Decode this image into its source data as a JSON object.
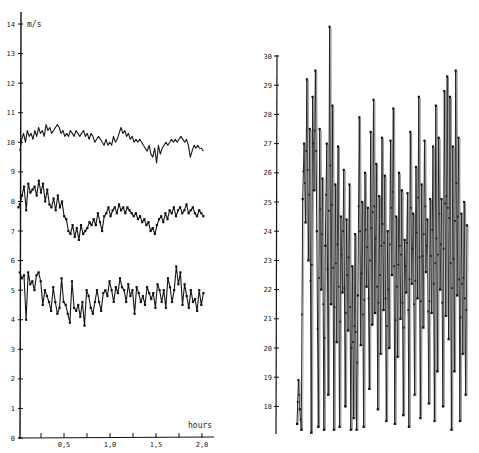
{
  "chart_data": [
    {
      "type": "line",
      "title": "",
      "xlabel": "hours",
      "ylabel": "m/s",
      "xlim": [
        0,
        2.1
      ],
      "ylim": [
        0,
        14
      ],
      "grid": false,
      "legend": "none",
      "x_ticks": [
        0.25,
        0.5,
        0.75,
        1.0,
        1.25,
        1.5,
        1.75,
        2.0
      ],
      "x_tick_labels": [
        {
          "value": 0.5,
          "label": "0,5"
        },
        {
          "value": 1.0,
          "label": "1,0"
        },
        {
          "value": 1.5,
          "label": "1,5"
        },
        {
          "value": 2.0,
          "label": "2,0"
        }
      ],
      "y_ticks": [
        0,
        1,
        2,
        3,
        4,
        5,
        6,
        7,
        8,
        9,
        10,
        11,
        12,
        13,
        14
      ],
      "y_tick_labels": [
        "0",
        "1",
        "2",
        "3",
        "4",
        "5",
        "6",
        "7",
        "8",
        "9",
        "10",
        "11",
        "12",
        "13",
        "14"
      ],
      "x_step": 0.02,
      "series": [
        {
          "name": "upper",
          "marker": "none",
          "values": [
            9.7,
            10.1,
            10.3,
            10.0,
            10.4,
            10.2,
            10.3,
            10.1,
            10.4,
            10.2,
            10.5,
            10.3,
            10.4,
            10.2,
            10.6,
            10.4,
            10.5,
            10.3,
            10.4,
            10.5,
            10.6,
            10.5,
            10.3,
            10.4,
            10.2,
            10.3,
            10.2,
            10.4,
            10.3,
            10.2,
            10.4,
            10.3,
            10.2,
            10.3,
            10.4,
            10.2,
            10.3,
            10.1,
            10.3,
            10.2,
            10.0,
            10.1,
            10.2,
            10.1,
            10.0,
            9.9,
            10.1,
            9.9,
            10.0,
            9.9,
            10.2,
            10.0,
            10.1,
            10.3,
            10.5,
            10.3,
            10.4,
            10.2,
            10.3,
            10.1,
            10.2,
            10.0,
            10.1,
            10.0,
            10.1,
            10.0,
            9.9,
            9.8,
            9.7,
            9.9,
            9.6,
            9.5,
            9.8,
            9.3,
            9.9,
            9.6,
            9.8,
            9.9,
            10.0,
            9.9,
            10.0,
            10.1,
            10.0,
            10.1,
            10.0,
            10.1,
            10.2,
            10.1,
            10.0,
            10.1,
            9.9,
            9.5,
            9.7,
            9.9,
            9.8,
            9.9,
            9.8,
            9.8,
            9.7
          ],
          "min_point": {
            "x": 1.63,
            "y": 9.2
          }
        },
        {
          "name": "middle",
          "marker": "dot",
          "values": [
            7.9,
            8.2,
            8.5,
            7.7,
            8.6,
            8.3,
            8.4,
            8.5,
            8.2,
            8.7,
            8.3,
            8.6,
            8.0,
            8.4,
            7.9,
            7.8,
            8.1,
            7.7,
            8.2,
            7.8,
            8.0,
            7.5,
            7.4,
            7.0,
            6.9,
            7.2,
            6.8,
            7.1,
            6.7,
            7.2,
            6.9,
            7.0,
            7.1,
            7.3,
            7.2,
            7.4,
            7.2,
            7.6,
            7.3,
            7.0,
            7.5,
            7.6,
            7.8,
            7.5,
            7.7,
            7.8,
            7.6,
            7.9,
            7.7,
            7.8,
            7.6,
            7.8,
            7.7,
            7.6,
            7.5,
            7.6,
            7.4,
            7.5,
            7.3,
            7.4,
            7.2,
            7.3,
            7.0,
            7.1,
            6.9,
            7.2,
            7.4,
            7.5,
            7.3,
            7.6,
            7.4,
            7.7,
            7.6,
            7.8,
            7.5,
            7.7,
            7.8,
            7.6,
            7.7,
            7.9,
            7.6,
            7.7,
            7.8,
            7.6,
            7.5,
            7.7,
            7.6,
            7.5
          ],
          "start_value": 7.8
        },
        {
          "name": "lower",
          "marker": "dot",
          "values": [
            5.6,
            5.4,
            5.5,
            4.0,
            5.6,
            5.2,
            5.3,
            5.0,
            5.5,
            5.6,
            5.3,
            4.5,
            5.0,
            4.8,
            4.6,
            4.3,
            5.1,
            4.6,
            4.2,
            4.4,
            5.4,
            4.6,
            4.5,
            4.2,
            3.9,
            5.3,
            4.4,
            4.3,
            4.5,
            4.1,
            4.6,
            3.8,
            5.0,
            4.8,
            4.4,
            4.2,
            4.6,
            5.0,
            4.6,
            4.3,
            4.9,
            5.0,
            4.8,
            5.3,
            5.0,
            4.6,
            5.1,
            4.9,
            5.4,
            5.1,
            5.0,
            4.6,
            5.2,
            4.8,
            5.0,
            4.2,
            5.1,
            4.9,
            4.6,
            4.8,
            4.5,
            5.1,
            4.9,
            4.7,
            4.9,
            4.4,
            5.2,
            5.0,
            4.6,
            5.0,
            4.4,
            5.4,
            5.1,
            4.6,
            5.0,
            5.8,
            5.2,
            5.6,
            4.5,
            5.2,
            4.8,
            4.4,
            5.0,
            4.6,
            4.7,
            4.3,
            5.0,
            4.5,
            4.9
          ],
          "min_point": {
            "x": 0.08,
            "y": 4.0
          }
        }
      ]
    },
    {
      "type": "line",
      "title": "",
      "xlabel": "",
      "ylabel": "",
      "ylim": [
        17.1,
        30
      ],
      "grid": false,
      "legend": "none",
      "y_ticks": [
        18,
        19,
        20,
        21,
        22,
        23,
        24,
        25,
        26,
        27,
        28,
        29,
        30
      ],
      "y_tick_labels": [
        "18",
        "19",
        "20",
        "21",
        "22",
        "23",
        "24",
        "25",
        "26",
        "27",
        "28",
        "29",
        "30"
      ],
      "series": [
        {
          "name": "series",
          "marker": "dot",
          "values": [
            17.4,
            18.9,
            17.9,
            17.2,
            25.1,
            27.0,
            24.3,
            29.2,
            23.0,
            27.5,
            17.1,
            28.6,
            25.4,
            29.5,
            24.0,
            17.3,
            27.5,
            22.0,
            25.8,
            17.2,
            23.5,
            27.0,
            18.4,
            31.0,
            21.5,
            28.3,
            17.2,
            25.6,
            20.2,
            26.9,
            17.3,
            24.5,
            21.9,
            26.1,
            18.0,
            24.4,
            20.6,
            25.6,
            17.2,
            22.8,
            17.6,
            23.9,
            17.2,
            21.8,
            27.9,
            20.1,
            25.0,
            17.3,
            26.0,
            22.1,
            24.8,
            18.6,
            27.4,
            20.8,
            28.5,
            21.2,
            26.3,
            17.9,
            25.2,
            19.8,
            27.2,
            21.3,
            25.9,
            17.5,
            24.0,
            20.0,
            27.1,
            22.5,
            28.2,
            17.4,
            24.5,
            19.7,
            26.0,
            21.0,
            25.4,
            17.7,
            23.7,
            21.9,
            25.3,
            17.3,
            27.4,
            22.2,
            24.6,
            18.4,
            26.2,
            21.7,
            28.6,
            17.6,
            25.6,
            20.7,
            27.1,
            22.6,
            24.4,
            18.1,
            25.1,
            21.2,
            26.9,
            17.5,
            28.3,
            19.2,
            27.2,
            22.0,
            25.1,
            18.0,
            28.8,
            21.1,
            29.3,
            20.3,
            28.6,
            17.2,
            26.9,
            19.2,
            29.5,
            21.8,
            27.2,
            17.5,
            24.6,
            19.8,
            25.0,
            18.4,
            24.2
          ]
        }
      ]
    }
  ]
}
